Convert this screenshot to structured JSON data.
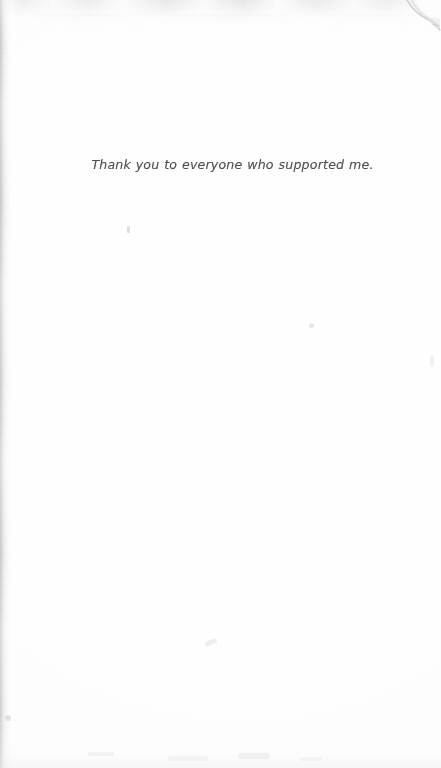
{
  "document": {
    "page_kind": "scanned-dedication-page",
    "background_color": "#fefefe",
    "text_color": "#4c4c4f"
  },
  "body": {
    "dedication_text": "Thank you to everyone who supported me."
  },
  "artifacts": {
    "left_edge_shadow": "scan-shadow-band",
    "top_smudge_band": "scan-smudge-band",
    "corner_curl": "page-curl-top-right",
    "specks": [
      "speck-mark",
      "speck-mark",
      "speck-mark",
      "speck-mark",
      "speck-mark",
      "speck-mark",
      "speck-mark",
      "speck-mark",
      "speck-mark"
    ]
  }
}
